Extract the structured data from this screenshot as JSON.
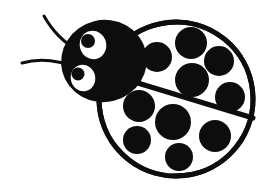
{
  "artwork": {
    "title": "Ladybug",
    "subject": "ladybug-clipart",
    "style": "black-and-white line art",
    "canvas": {
      "width": 274,
      "height": 188
    },
    "colors": {
      "background": "#ffffff",
      "ink": "#0d0d0d",
      "wing_fill": "#ffffff",
      "eye_white": "#ffffff",
      "pupil": "#0d0d0d"
    },
    "body": {
      "shape": "ellipse",
      "center_x": 176,
      "center_y": 99,
      "radius_x": 77,
      "radius_y": 77,
      "rotation_deg": -6,
      "outline_width": 5,
      "fill": "#ffffff"
    },
    "wing_divider": {
      "label": "elytra-seam",
      "x1": 118,
      "y1": 77,
      "x2": 253,
      "y2": 118,
      "stroke_width": 5
    },
    "head": {
      "shape": "ellipse",
      "center_x": 104,
      "center_y": 61,
      "radius_x": 43,
      "radius_y": 41,
      "rotation_deg": -14,
      "fill": "#0d0d0d"
    },
    "eyes": [
      {
        "name": "eye-upper",
        "center_x": 93,
        "center_y": 45,
        "radius_x": 14,
        "radius_y": 15,
        "rotation_deg": -12,
        "pupil": {
          "center_x": 88,
          "center_y": 41,
          "radius": 7
        }
      },
      {
        "name": "eye-lower",
        "center_x": 83,
        "center_y": 78,
        "radius_x": 13,
        "radius_y": 14,
        "rotation_deg": -12,
        "pupil": {
          "center_x": 78,
          "center_y": 74,
          "radius": 6.5
        }
      }
    ],
    "antennae": [
      {
        "name": "antenna-upper",
        "path": "M 44 16 C 52 30, 62 42, 82 53",
        "stroke_width": 3
      },
      {
        "name": "antenna-lower",
        "path": "M 22 63 C 40 58, 58 60, 78 68",
        "stroke_width": 3
      }
    ],
    "spots": {
      "count_total": 10,
      "upper_wing": [
        {
          "id": "spot-u1",
          "cx": 157,
          "cy": 57,
          "r": 15
        },
        {
          "id": "spot-u2",
          "cx": 191,
          "cy": 43,
          "r": 16
        },
        {
          "id": "spot-u3",
          "cx": 219,
          "cy": 61,
          "r": 15
        },
        {
          "id": "spot-u4",
          "cx": 192,
          "cy": 80,
          "r": 17
        },
        {
          "id": "spot-u5",
          "cx": 230,
          "cy": 97,
          "r": 15
        }
      ],
      "lower_wing": [
        {
          "id": "spot-l1",
          "cx": 139,
          "cy": 106,
          "r": 16
        },
        {
          "id": "spot-l2",
          "cx": 173,
          "cy": 122,
          "r": 18
        },
        {
          "id": "spot-l3",
          "cx": 137,
          "cy": 140,
          "r": 14
        },
        {
          "id": "spot-l4",
          "cx": 179,
          "cy": 157,
          "r": 14
        },
        {
          "id": "spot-l5",
          "cx": 215,
          "cy": 136,
          "r": 16
        }
      ]
    }
  }
}
